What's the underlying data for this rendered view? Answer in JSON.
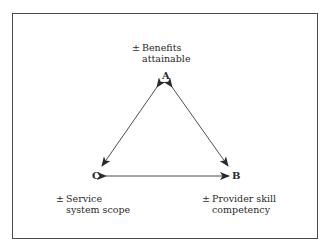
{
  "diagram": {
    "nodes": [
      {
        "id": "A",
        "label": "A",
        "desc_line1": "Benefits",
        "desc_line2": "attainable",
        "sign": "±"
      },
      {
        "id": "B",
        "label": "B",
        "desc_line1": "Provider skill",
        "desc_line2": "competency",
        "sign": "±"
      },
      {
        "id": "C",
        "label": "C",
        "desc_line1": "Service",
        "desc_line2": "system scope",
        "sign": "±"
      }
    ],
    "edges": [
      {
        "from": "A",
        "to": "C",
        "bidirectional": true
      },
      {
        "from": "A",
        "to": "B",
        "bidirectional": true
      },
      {
        "from": "C",
        "to": "B",
        "bidirectional": true
      }
    ],
    "colors": {
      "stroke": "#3a3a3a",
      "frame": "#4a4a4a",
      "background": "#ffffff"
    }
  }
}
